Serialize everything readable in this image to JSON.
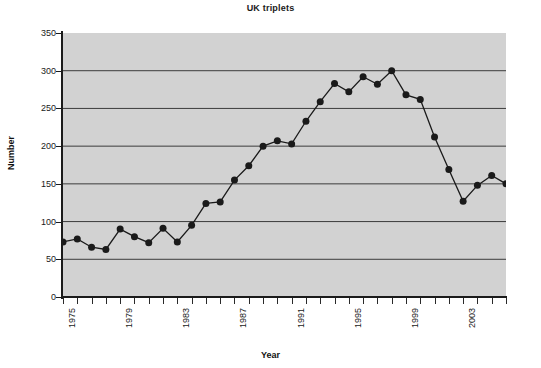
{
  "chart_data": {
    "type": "line",
    "title": "UK triplets",
    "xlabel": "Year",
    "ylabel": "Number",
    "xlim": [
      1975,
      2006
    ],
    "ylim": [
      0,
      350
    ],
    "yticks": [
      0,
      50,
      100,
      150,
      200,
      250,
      300,
      350
    ],
    "xticks": [
      1975,
      1979,
      1983,
      1987,
      1991,
      1995,
      1999,
      2003
    ],
    "xtick_rotation": -90,
    "grid": "horizontal",
    "legend": "none",
    "marker": "filled-circle",
    "x": [
      1975,
      1976,
      1977,
      1978,
      1979,
      1980,
      1981,
      1982,
      1983,
      1984,
      1985,
      1986,
      1987,
      1988,
      1989,
      1990,
      1991,
      1992,
      1993,
      1994,
      1995,
      1996,
      1997,
      1998,
      1999,
      2000,
      2001,
      2002,
      2003,
      2004,
      2005,
      2006
    ],
    "values": [
      73,
      77,
      66,
      63,
      90,
      80,
      72,
      91,
      73,
      95,
      124,
      126,
      155,
      174,
      200,
      207,
      203,
      233,
      259,
      283,
      272,
      292,
      282,
      300,
      268,
      262,
      212,
      169,
      127,
      148,
      161,
      150
    ],
    "series": [
      {
        "name": "UK triplets",
        "color": "#1a1a1a",
        "values": [
          73,
          77,
          66,
          63,
          90,
          80,
          72,
          91,
          73,
          95,
          124,
          126,
          155,
          174,
          200,
          207,
          203,
          233,
          259,
          283,
          272,
          292,
          282,
          300,
          268,
          262,
          212,
          169,
          127,
          148,
          161,
          150
        ]
      }
    ],
    "plot_background": "#d2d2d2",
    "gridline_color": "#3c3c3c",
    "axis_color": "#1b1b1b"
  }
}
